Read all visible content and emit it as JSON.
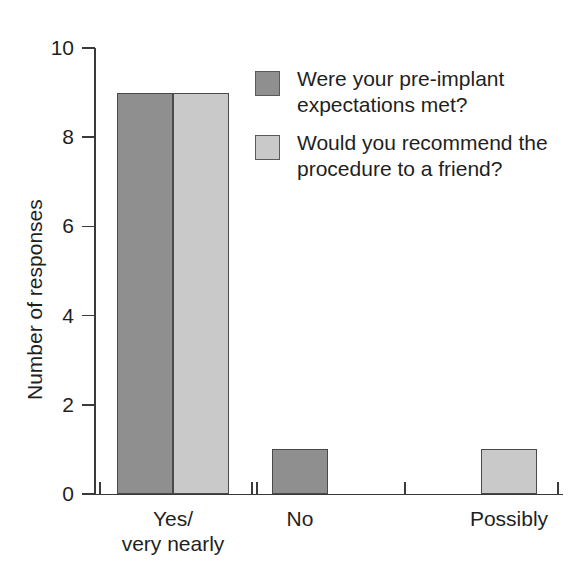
{
  "chart_data": {
    "type": "bar",
    "title": "",
    "xlabel": "",
    "ylabel": "Number of responses",
    "categories": [
      "Yes/\nvery nearly",
      "No",
      "Possibly"
    ],
    "ylim": [
      0,
      10
    ],
    "yticks": [
      0,
      2,
      4,
      6,
      8,
      10
    ],
    "ytick_labels": [
      "0",
      "2",
      "4",
      "6",
      "8",
      "10"
    ],
    "grid": false,
    "legend_position": "top-right",
    "series": [
      {
        "name": "Were your pre-implant\nexpectations met?",
        "color": "#8f8f8f",
        "values": [
          9,
          1,
          0
        ]
      },
      {
        "name": "Would you recommend the\nprocedure to a friend?",
        "color": "#c9c9c9",
        "values": [
          9,
          0,
          1
        ]
      }
    ]
  },
  "axes": {
    "y_title": "Number of responses",
    "y_ticks": [
      {
        "label": "10",
        "value": 10
      },
      {
        "label": "8",
        "value": 8
      },
      {
        "label": "6",
        "value": 6
      },
      {
        "label": "4",
        "value": 4
      },
      {
        "label": "2",
        "value": 2
      },
      {
        "label": "0",
        "value": 0
      }
    ],
    "x_labels": [
      {
        "text": "Yes/\nvery nearly"
      },
      {
        "text": "No"
      },
      {
        "text": "Possibly"
      }
    ]
  },
  "legend": {
    "items": [
      {
        "label": "Were your pre-implant\nexpectations met?",
        "color": "#8f8f8f"
      },
      {
        "label": "Would you recommend the\nprocedure to a friend?",
        "color": "#c9c9c9"
      }
    ]
  },
  "bars": [
    {
      "name": "bar-yes-expectations",
      "series": 0,
      "category": 0,
      "value": 9,
      "color": "#8f8f8f",
      "x": 117,
      "width": 56
    },
    {
      "name": "bar-yes-recommend",
      "series": 1,
      "category": 0,
      "value": 9,
      "color": "#c9c9c9",
      "x": 173,
      "width": 56
    },
    {
      "name": "bar-no-expectations",
      "series": 0,
      "category": 1,
      "value": 1,
      "color": "#8f8f8f",
      "x": 272,
      "width": 56
    },
    {
      "name": "bar-possibly-recommend",
      "series": 1,
      "category": 2,
      "value": 1,
      "color": "#c9c9c9",
      "x": 481,
      "width": 56
    }
  ],
  "geometry": {
    "plot_top": 48,
    "plot_bottom": 494,
    "x_tick_positions": [
      99,
      251,
      256,
      404,
      557
    ],
    "x_label_positions": [
      173,
      300,
      509
    ]
  },
  "colors": {
    "series_dark": "#8f8f8f",
    "series_light": "#c9c9c9",
    "axis": "#3a3a3a",
    "text": "#1f1f1f",
    "background": "#ffffff"
  }
}
